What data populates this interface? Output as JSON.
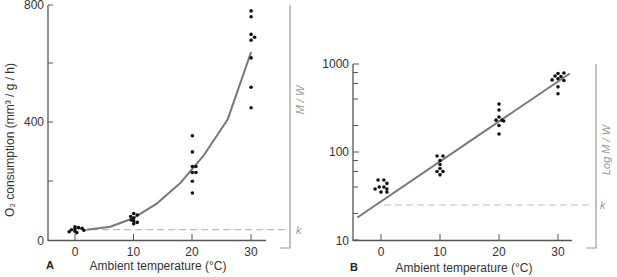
{
  "chart_data": [
    {
      "panel": "A",
      "type": "scatter",
      "title": "",
      "xlabel": "Ambient temperature (°C)",
      "ylabel": "O₂ consumption (mm³ / g / h)",
      "xlim": [
        -5,
        33
      ],
      "ylim": [
        0,
        800
      ],
      "x_ticks": [
        0,
        10,
        20,
        30
      ],
      "y_tick_labels": [
        0,
        400,
        800
      ],
      "y_minor_ticks": [
        200,
        600
      ],
      "yscale": "linear",
      "grid": false,
      "side_bracket_label": "M / W",
      "baseline_label": "k",
      "baseline_value": 35,
      "series": [
        {
          "name": "observations",
          "points": [
            [
              0,
              30
            ],
            [
              0,
              38
            ],
            [
              0,
              45
            ],
            [
              -0.6,
              35
            ],
            [
              0.6,
              42
            ],
            [
              1.2,
              40
            ],
            [
              -1,
              28
            ],
            [
              0.3,
              25
            ],
            [
              1.5,
              33
            ],
            [
              10,
              55
            ],
            [
              10,
              65
            ],
            [
              10,
              75
            ],
            [
              10,
              90
            ],
            [
              9.5,
              80
            ],
            [
              10.6,
              85
            ],
            [
              10.6,
              60
            ],
            [
              9.6,
              68
            ],
            [
              20,
              160
            ],
            [
              20,
              200
            ],
            [
              20,
              230
            ],
            [
              20,
              250
            ],
            [
              20.6,
              250
            ],
            [
              20.6,
              230
            ],
            [
              20,
              300
            ],
            [
              20,
              355
            ],
            [
              30,
              450
            ],
            [
              30,
              520
            ],
            [
              30,
              620
            ],
            [
              30,
              680
            ],
            [
              30,
              700
            ],
            [
              30.6,
              690
            ],
            [
              30,
              760
            ],
            [
              30,
              780
            ]
          ]
        },
        {
          "name": "fitted curve",
          "type": "line",
          "points": [
            [
              2,
              35
            ],
            [
              6,
              45
            ],
            [
              10,
              75
            ],
            [
              14,
              125
            ],
            [
              18,
              195
            ],
            [
              22,
              290
            ],
            [
              26,
              410
            ],
            [
              30,
              640
            ]
          ]
        }
      ]
    },
    {
      "panel": "B",
      "type": "scatter",
      "title": "",
      "xlabel": "Ambient temperature (°C)",
      "ylabel": "",
      "xlim": [
        -5,
        33
      ],
      "ylim": [
        10,
        1000
      ],
      "x_ticks": [
        0,
        10,
        20,
        30
      ],
      "y_tick_labels": [
        10,
        100,
        1000
      ],
      "y_minor_ticks": [
        20,
        40,
        60,
        80,
        200,
        400,
        600,
        800
      ],
      "yscale": "log",
      "grid": false,
      "side_bracket_label": "Log M / W",
      "baseline_label": "k",
      "baseline_value": 25,
      "series": [
        {
          "name": "observations",
          "points": [
            [
              -0.5,
              48
            ],
            [
              0.5,
              48
            ],
            [
              1,
              44
            ],
            [
              -0.3,
              40
            ],
            [
              0.5,
              40
            ],
            [
              1,
              38
            ],
            [
              -1,
              38
            ],
            [
              0,
              35
            ],
            [
              1,
              35
            ],
            [
              9.5,
              90
            ],
            [
              10.5,
              90
            ],
            [
              10,
              80
            ],
            [
              10,
              72
            ],
            [
              10,
              65
            ],
            [
              9.5,
              60
            ],
            [
              10.5,
              60
            ],
            [
              10,
              55
            ],
            [
              20,
              350
            ],
            [
              20,
              300
            ],
            [
              20,
              250
            ],
            [
              19.5,
              230
            ],
            [
              20.5,
              230
            ],
            [
              20.8,
              225
            ],
            [
              20,
              200
            ],
            [
              20,
              160
            ],
            [
              30,
              780
            ],
            [
              31,
              790
            ],
            [
              29.5,
              730
            ],
            [
              30.5,
              720
            ],
            [
              30,
              680
            ],
            [
              29,
              660
            ],
            [
              31,
              650
            ],
            [
              30,
              550
            ],
            [
              30,
              460
            ]
          ]
        },
        {
          "name": "fitted line",
          "type": "line",
          "points": [
            [
              -4,
              18
            ],
            [
              32,
              780
            ]
          ]
        }
      ]
    }
  ],
  "labels": {
    "panel_a": "A",
    "panel_b": "B",
    "x_axis_title": "Ambient temperature (°C)",
    "y_axis_title_a": "O₂ consumption (mm³ / g / h)",
    "side_a": "M / W",
    "side_b": "Log M / W",
    "k": "k",
    "xticks": [
      "0",
      "10",
      "20",
      "30"
    ],
    "a_yticks": [
      "800",
      "400",
      "0"
    ],
    "b_yticks": [
      "1000",
      "100",
      "10"
    ]
  },
  "colors": {
    "axis": "#555555",
    "points": "#111111",
    "curve": "#777777",
    "baseline": "#bbbbbb",
    "bracket": "#999999"
  }
}
